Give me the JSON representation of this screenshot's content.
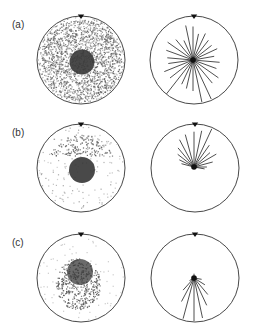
{
  "figure": {
    "panels": [
      {
        "label": "(a)",
        "left_plot": {
          "description": "wear/damage pattern, dense scatter over whole disk with dark central core",
          "coverage": "full-disk",
          "core": "centered"
        },
        "right_plot": {
          "description": "rose diagram, rays in all directions",
          "rays": [
            {
              "angle_deg": 0,
              "length": 0.78
            },
            {
              "angle_deg": 12,
              "length": 0.62
            },
            {
              "angle_deg": 25,
              "length": 0.68
            },
            {
              "angle_deg": 38,
              "length": 0.58
            },
            {
              "angle_deg": 52,
              "length": 0.55
            },
            {
              "angle_deg": 65,
              "length": 0.62
            },
            {
              "angle_deg": 80,
              "length": 0.5
            },
            {
              "angle_deg": 95,
              "length": 0.62
            },
            {
              "angle_deg": 110,
              "length": 0.58
            },
            {
              "angle_deg": 125,
              "length": 0.72
            },
            {
              "angle_deg": 140,
              "length": 0.7
            },
            {
              "angle_deg": 155,
              "length": 1.0
            },
            {
              "angle_deg": 168,
              "length": 1.0
            },
            {
              "angle_deg": 180,
              "length": 0.72
            },
            {
              "angle_deg": 193,
              "length": 0.68
            },
            {
              "angle_deg": 205,
              "length": 0.62
            },
            {
              "angle_deg": 218,
              "length": 1.0
            },
            {
              "angle_deg": 232,
              "length": 0.68
            },
            {
              "angle_deg": 248,
              "length": 0.72
            },
            {
              "angle_deg": 262,
              "length": 0.58
            },
            {
              "angle_deg": 275,
              "length": 0.6
            },
            {
              "angle_deg": 290,
              "length": 0.66
            },
            {
              "angle_deg": 305,
              "length": 0.72
            },
            {
              "angle_deg": 320,
              "length": 0.62
            },
            {
              "angle_deg": 335,
              "length": 0.5
            },
            {
              "angle_deg": 348,
              "length": 0.82
            }
          ]
        }
      },
      {
        "label": "(b)",
        "left_plot": {
          "description": "scatter concentrated in upper arc with dark central core",
          "coverage": "upper-arc",
          "core": "centered"
        },
        "right_plot": {
          "description": "rose diagram, rays toward upper half",
          "rays": [
            {
              "angle_deg": 0,
              "length": 0.82
            },
            {
              "angle_deg": 12,
              "length": 0.86
            },
            {
              "angle_deg": 25,
              "length": 0.98
            },
            {
              "angle_deg": 35,
              "length": 0.62
            },
            {
              "angle_deg": 48,
              "length": 0.5
            },
            {
              "angle_deg": 60,
              "length": 0.6
            },
            {
              "angle_deg": 75,
              "length": 0.45
            },
            {
              "angle_deg": 90,
              "length": 0.3
            },
            {
              "angle_deg": 100,
              "length": 0.25
            },
            {
              "angle_deg": 345,
              "length": 0.78
            },
            {
              "angle_deg": 332,
              "length": 0.72
            },
            {
              "angle_deg": 320,
              "length": 0.58
            },
            {
              "angle_deg": 308,
              "length": 0.48
            },
            {
              "angle_deg": 296,
              "length": 0.38
            },
            {
              "angle_deg": 285,
              "length": 0.3
            }
          ]
        }
      },
      {
        "label": "(c)",
        "left_plot": {
          "description": "dark cluster around core, extending downward",
          "coverage": "lower-cluster",
          "core": "centered"
        },
        "right_plot": {
          "description": "rose diagram, rays toward lower half",
          "rays": [
            {
              "angle_deg": 180,
              "length": 1.0
            },
            {
              "angle_deg": 168,
              "length": 0.95
            },
            {
              "angle_deg": 155,
              "length": 0.7
            },
            {
              "angle_deg": 140,
              "length": 0.5
            },
            {
              "angle_deg": 122,
              "length": 0.3
            },
            {
              "angle_deg": 195,
              "length": 0.98
            },
            {
              "angle_deg": 208,
              "length": 0.62
            },
            {
              "angle_deg": 222,
              "length": 0.38
            },
            {
              "angle_deg": 240,
              "length": 0.12
            },
            {
              "angle_deg": 0,
              "length": 0.1
            },
            {
              "angle_deg": 100,
              "length": 0.18
            }
          ]
        }
      }
    ],
    "marker": "top-triangle",
    "colors": {
      "outline": "#333333",
      "core": "#3a3a3a",
      "scatter": "#555555",
      "ray": "#222222"
    }
  }
}
